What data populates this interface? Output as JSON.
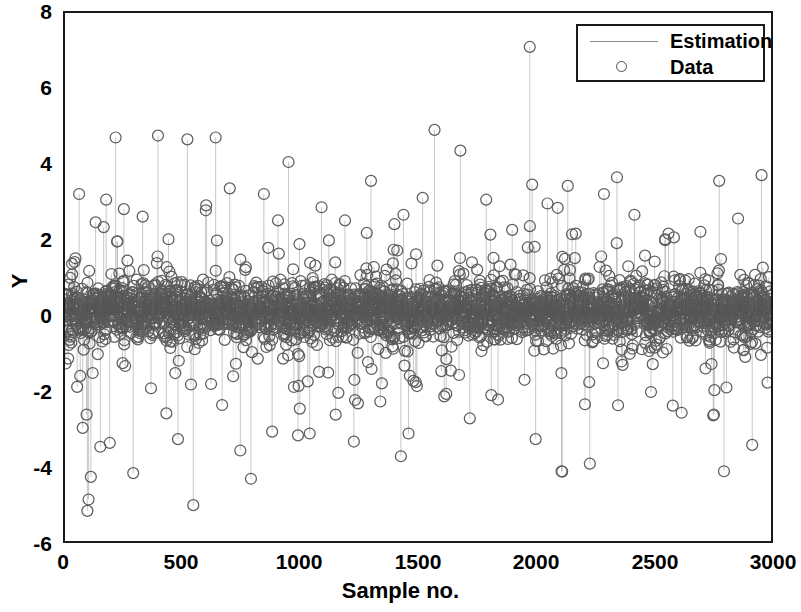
{
  "chart_data": {
    "type": "scatter",
    "plot_style": "stem",
    "title": "",
    "xlabel": "Sample no.",
    "ylabel": "Y",
    "xlim": [
      0,
      3000
    ],
    "ylim": [
      -6,
      8
    ],
    "xticks": [
      0,
      500,
      1000,
      1500,
      2000,
      2500,
      3000
    ],
    "xtick_labels": [
      "0",
      "500",
      "1000",
      "1500",
      "2000",
      "2500",
      "3000"
    ],
    "yticks": [
      -6,
      -4,
      -2,
      0,
      2,
      4,
      6,
      8
    ],
    "ytick_labels": [
      "-6",
      "-4",
      "-2",
      "0",
      "2",
      "4",
      "6",
      "8"
    ],
    "grid": false,
    "box": true,
    "tick_direction": "in",
    "legend": {
      "position": "top-right",
      "entries": [
        {
          "label": "Estimation",
          "marker": "line",
          "color": "#8c8c8c"
        },
        {
          "label": "Data",
          "marker": "circle",
          "color": "#4d4d4d"
        }
      ]
    },
    "series": [
      {
        "name": "Estimation",
        "type": "line",
        "render": "vertical-stems",
        "color": "#a0a0a0",
        "description": "Thin vertical stem lines drawn from y=0 up/down to each data marker"
      },
      {
        "name": "Data",
        "type": "scatter",
        "marker": "o",
        "marker_filled": false,
        "marker_size": 11,
        "color": "#4d4d4d",
        "n_points": 3000,
        "description": "Residual-like noise samples; dense saturated band between about -0.7 and +0.9, sparse outliers out to +7.1 and -5.2",
        "dense_band": {
          "low": -0.7,
          "high": 0.9,
          "fraction": 0.82
        },
        "extremes": {
          "max": 7.1,
          "max_x": 1980,
          "min": -5.2,
          "min_x": 100
        },
        "notable_points": [
          {
            "x": 30,
            "y": 1.35
          },
          {
            "x": 60,
            "y": 3.2
          },
          {
            "x": 75,
            "y": -3.0
          },
          {
            "x": 95,
            "y": -5.2
          },
          {
            "x": 100,
            "y": -4.9
          },
          {
            "x": 110,
            "y": -4.3
          },
          {
            "x": 130,
            "y": 2.45
          },
          {
            "x": 150,
            "y": -3.5
          },
          {
            "x": 175,
            "y": 3.05
          },
          {
            "x": 190,
            "y": -3.4
          },
          {
            "x": 215,
            "y": 4.7
          },
          {
            "x": 250,
            "y": 2.8
          },
          {
            "x": 290,
            "y": -4.2
          },
          {
            "x": 330,
            "y": 2.6
          },
          {
            "x": 395,
            "y": 4.75
          },
          {
            "x": 440,
            "y": 2.0
          },
          {
            "x": 480,
            "y": -3.3
          },
          {
            "x": 520,
            "y": 4.65
          },
          {
            "x": 545,
            "y": -5.05
          },
          {
            "x": 600,
            "y": 2.9
          },
          {
            "x": 640,
            "y": 4.7
          },
          {
            "x": 700,
            "y": 3.35
          },
          {
            "x": 745,
            "y": -3.6
          },
          {
            "x": 790,
            "y": -4.35
          },
          {
            "x": 845,
            "y": 3.2
          },
          {
            "x": 880,
            "y": -3.1
          },
          {
            "x": 905,
            "y": 2.5
          },
          {
            "x": 950,
            "y": 4.05
          },
          {
            "x": 990,
            "y": -3.2
          },
          {
            "x": 1040,
            "y": -3.15
          },
          {
            "x": 1090,
            "y": 2.85
          },
          {
            "x": 1150,
            "y": -2.65
          },
          {
            "x": 1190,
            "y": 2.5
          },
          {
            "x": 1245,
            "y": -2.35
          },
          {
            "x": 1300,
            "y": 3.55
          },
          {
            "x": 1340,
            "y": -2.3
          },
          {
            "x": 1400,
            "y": 2.4
          },
          {
            "x": 1460,
            "y": -3.15
          },
          {
            "x": 1520,
            "y": 3.1
          },
          {
            "x": 1570,
            "y": 4.9
          },
          {
            "x": 1620,
            "y": -2.1
          },
          {
            "x": 1680,
            "y": 4.35
          },
          {
            "x": 1720,
            "y": -2.75
          },
          {
            "x": 1790,
            "y": 3.05
          },
          {
            "x": 1840,
            "y": -2.25
          },
          {
            "x": 1900,
            "y": 2.25
          },
          {
            "x": 1975,
            "y": 7.1
          },
          {
            "x": 1985,
            "y": 3.45
          },
          {
            "x": 2000,
            "y": -3.3
          },
          {
            "x": 2050,
            "y": 2.95
          },
          {
            "x": 2110,
            "y": -4.15
          },
          {
            "x": 2170,
            "y": 2.15
          },
          {
            "x": 2230,
            "y": -3.95
          },
          {
            "x": 2290,
            "y": 3.2
          },
          {
            "x": 2350,
            "y": -2.4
          },
          {
            "x": 2420,
            "y": 2.65
          },
          {
            "x": 2490,
            "y": -2.05
          },
          {
            "x": 2550,
            "y": 2.0
          },
          {
            "x": 2620,
            "y": -2.6
          },
          {
            "x": 2700,
            "y": 2.2
          },
          {
            "x": 2780,
            "y": 3.55
          },
          {
            "x": 2800,
            "y": -4.15
          },
          {
            "x": 2860,
            "y": 2.55
          },
          {
            "x": 2920,
            "y": -3.45
          },
          {
            "x": 2960,
            "y": 3.7
          },
          {
            "x": 2985,
            "y": -1.8
          }
        ]
      }
    ]
  },
  "axes": {
    "x_title": "Sample no.",
    "y_title": "Y"
  },
  "legend": {
    "estimation_label": "Estimation",
    "data_label": "Data"
  },
  "colors": {
    "marker": "#4d4d4d",
    "stem": "#a0a0a0",
    "axis": "#1a1a1a",
    "background": "#ffffff"
  }
}
